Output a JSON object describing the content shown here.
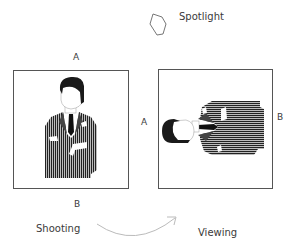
{
  "labels": {
    "spotlight": "Spotlight",
    "left_top": "A",
    "left_bottom": "B",
    "right_left": "A",
    "right_right": "B",
    "shooting": "Shooting",
    "viewing": "Viewing"
  },
  "icons": {
    "spotlight": "spotlight-shape-icon",
    "arrow": "curved-arrow-icon"
  },
  "colors": {
    "frame": "#555555",
    "suit": "#2a2a2a",
    "text": "#3a3a3a",
    "arrow": "#bbbbbb"
  }
}
